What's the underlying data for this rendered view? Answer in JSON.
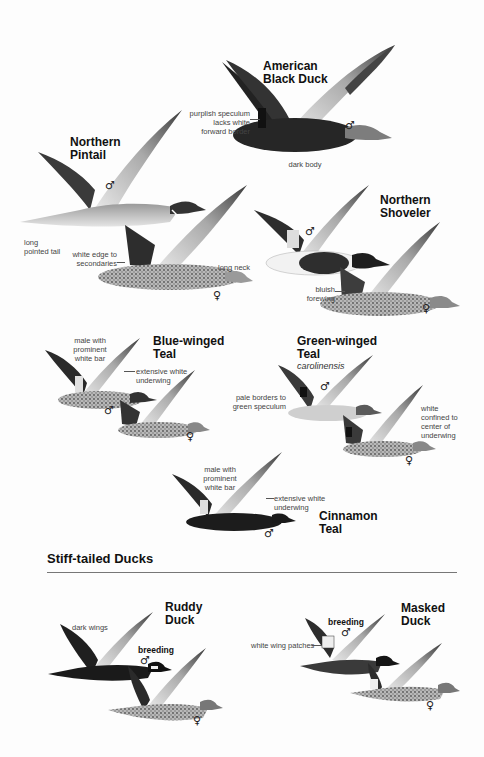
{
  "species": [
    {
      "id": "american-black-duck",
      "name_line1": "American",
      "name_line2": "Black Duck",
      "notes": [
        "purplish speculum",
        "lacks white",
        "forward border",
        "dark body"
      ],
      "sexes": [
        "♂"
      ]
    },
    {
      "id": "northern-pintail",
      "name_line1": "Northern",
      "name_line2": "Pintail",
      "notes": [
        "long",
        "pointed tail",
        "white edge to",
        "secondaries",
        "long neck"
      ],
      "sexes": [
        "♂",
        "♀"
      ]
    },
    {
      "id": "northern-shoveler",
      "name_line1": "Northern",
      "name_line2": "Shoveler",
      "notes": [
        "bluish",
        "forewing"
      ],
      "sexes": [
        "♂",
        "♀"
      ]
    },
    {
      "id": "blue-winged-teal",
      "name_line1": "Blue-winged",
      "name_line2": "Teal",
      "notes": [
        "male with",
        "prominent",
        "white bar",
        "extensive white",
        "underwing"
      ],
      "sexes": [
        "♂",
        "♀"
      ]
    },
    {
      "id": "green-winged-teal",
      "name_line1": "Green-winged",
      "name_line2": "Teal",
      "subspecies": "carolinensis",
      "notes": [
        "pale borders to",
        "green speculum",
        "white",
        "confined to",
        "center of",
        "underwing"
      ],
      "sexes": [
        "♂",
        "♀"
      ]
    },
    {
      "id": "cinnamon-teal",
      "name_line1": "Cinnamon",
      "name_line2": "Teal",
      "notes": [
        "male with",
        "prominent",
        "white bar",
        "extensive white",
        "underwing"
      ],
      "sexes": [
        "♂"
      ]
    },
    {
      "id": "ruddy-duck",
      "name_line1": "Ruddy",
      "name_line2": "Duck",
      "notes": [
        "dark wings"
      ],
      "breeding_label": "breeding",
      "sexes": [
        "♂",
        "♀"
      ]
    },
    {
      "id": "masked-duck",
      "name_line1": "Masked",
      "name_line2": "Duck",
      "notes": [
        "white wing patches"
      ],
      "breeding_label": "breeding",
      "sexes": [
        "♂",
        "♀"
      ]
    }
  ],
  "section": {
    "title": "Stiff-tailed Ducks"
  },
  "colors": {
    "ink": "#111111",
    "dark_bird": "#2a2a2a",
    "mid_bird": "#8a8a8a",
    "light_bird": "#d6d6d6",
    "rule": "#777777"
  }
}
